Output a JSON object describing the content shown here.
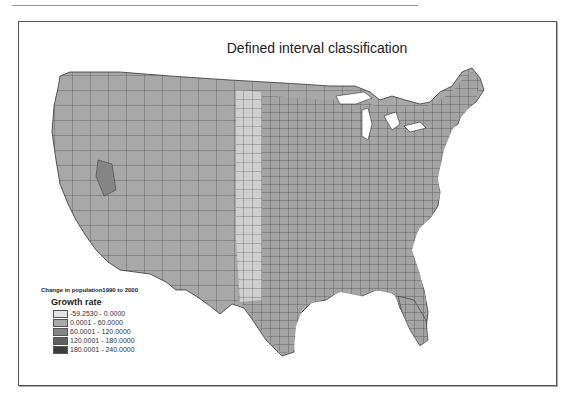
{
  "map": {
    "title": "Defined interval classification",
    "legend": {
      "heading": "Change in population1990 to 2000",
      "subheading": "Growth rate",
      "classes": [
        {
          "label": "-59.2530 - 0.0000",
          "color": "#e4e4e4"
        },
        {
          "label": "0.0001 - 60.0000",
          "color": "#a9a9a9"
        },
        {
          "label": "60.0001 - 120.0000",
          "color": "#858585"
        },
        {
          "label": "120.0001 - 180.0000",
          "color": "#5f5f5f"
        },
        {
          "label": "180.0001 - 240.0000",
          "color": "#3c3c3c"
        }
      ]
    }
  }
}
